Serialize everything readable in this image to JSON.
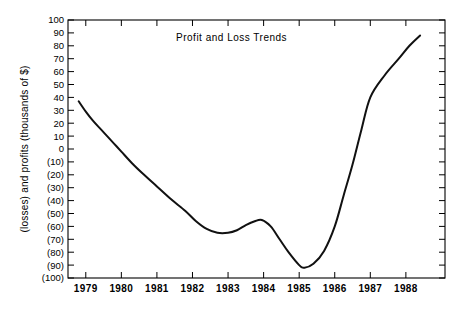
{
  "chart_data": {
    "type": "line",
    "title": "Profit and Loss Trends",
    "xlabel": "",
    "ylabel": "(losses) and profits (thousands of $)",
    "xlim": [
      1978.5,
      1989.1
    ],
    "ylim": [
      -100,
      100
    ],
    "grid": false,
    "legend": null,
    "x_tick_labels": [
      "1979",
      "1980",
      "1981",
      "1982",
      "1983",
      "1984",
      "1985",
      "1986",
      "1987",
      "1988"
    ],
    "x_tick_values": [
      1979,
      1980,
      1981,
      1982,
      1983,
      1984,
      1985,
      1986,
      1987,
      1988
    ],
    "y_tick_labels": [
      "100",
      "90",
      "80",
      "70",
      "60",
      "50",
      "40",
      "30",
      "20",
      "10",
      "0",
      "(10)",
      "(20)",
      "(30)",
      "(40)",
      "(50)",
      "(60)",
      "(70)",
      "(80)",
      "(90)",
      "(100)"
    ],
    "y_tick_values": [
      100,
      90,
      80,
      70,
      60,
      50,
      40,
      30,
      20,
      10,
      0,
      -10,
      -20,
      -30,
      -40,
      -50,
      -60,
      -70,
      -80,
      -90,
      -100
    ],
    "series": [
      {
        "name": "Profit and Loss",
        "color": "#111111",
        "x": [
          1978.8,
          1979.0,
          1979.2,
          1979.4,
          1979.6,
          1979.8,
          1980.0,
          1980.3,
          1980.6,
          1981.0,
          1981.4,
          1981.8,
          1982.1,
          1982.4,
          1982.7,
          1983.0,
          1983.25,
          1983.5,
          1983.75,
          1983.95,
          1984.2,
          1984.45,
          1984.7,
          1985.0,
          1985.15,
          1985.4,
          1985.7,
          1986.0,
          1986.25,
          1986.5,
          1986.75,
          1987.0,
          1987.4,
          1987.8,
          1988.1,
          1988.4
        ],
        "y": [
          37,
          29,
          22,
          16,
          10,
          4,
          -2,
          -11,
          -19,
          -29,
          -39,
          -48,
          -56,
          -62,
          -65,
          -65,
          -63,
          -59,
          -56,
          -55,
          -60,
          -70,
          -80,
          -90,
          -92,
          -89,
          -79,
          -60,
          -36,
          -12,
          15,
          40,
          57,
          70,
          80,
          88
        ]
      }
    ]
  },
  "plot_geometry": {
    "left": 68,
    "right": 445,
    "top": 20,
    "bottom": 278
  }
}
